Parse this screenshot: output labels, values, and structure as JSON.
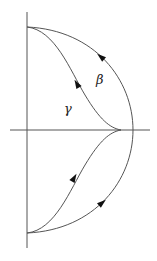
{
  "diagram": {
    "type": "contour-plot",
    "colors": {
      "stroke": "#555555",
      "arrow": "#111111",
      "background": "#ffffff"
    },
    "axes": {
      "vertical": {
        "x": 27,
        "y1": 12,
        "y2": 248
      },
      "horizontal": {
        "y": 130,
        "x1": 10,
        "x2": 150
      }
    },
    "points": {
      "top": [
        27,
        27
      ],
      "bottom": [
        27,
        233
      ],
      "junction": [
        121,
        130
      ]
    },
    "curves": [
      {
        "name": "beta",
        "label": "β",
        "path": "M27,27 C95,30 133,80 133,130 C133,180 95,230 27,233"
      },
      {
        "name": "gamma",
        "label": "γ",
        "path": "M27,27 C55,30 70,70 85,95 C100,120 110,128 121,130 C110,132 100,140 85,165 C70,190 55,230 27,233"
      }
    ],
    "labels": [
      {
        "name": "gamma-label",
        "text": "γ",
        "x": 64,
        "y": 113
      },
      {
        "name": "beta-label",
        "text": "β",
        "x": 96,
        "y": 84
      }
    ],
    "arrows": [
      {
        "name": "beta-upper-arrow",
        "x": 101,
        "y": 57,
        "angle": -140
      },
      {
        "name": "gamma-upper-arrow",
        "x": 77,
        "y": 84,
        "angle": -120
      },
      {
        "name": "gamma-lower-arrow",
        "x": 74,
        "y": 178,
        "angle": -60
      },
      {
        "name": "beta-lower-arrow",
        "x": 102,
        "y": 203,
        "angle": -40
      }
    ]
  }
}
